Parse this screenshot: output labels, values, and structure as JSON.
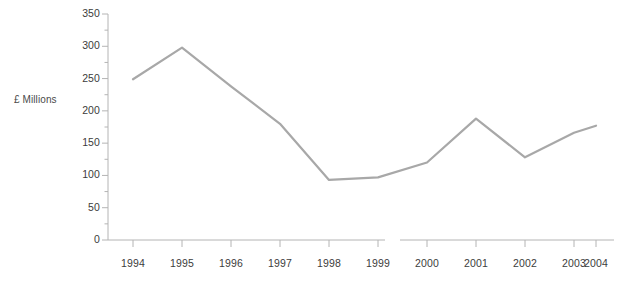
{
  "chart_data": {
    "type": "line",
    "title": "",
    "xlabel": "",
    "ylabel": "£ Millions",
    "categories": [
      "1994",
      "1995",
      "1996",
      "1997",
      "1998",
      "1999",
      "2000",
      "2001",
      "2002",
      "2003",
      "2004"
    ],
    "values": [
      249,
      298,
      238,
      180,
      93,
      97,
      120,
      188,
      128,
      166,
      177
    ],
    "series": [
      {
        "name": "£ Millions",
        "values": [
          249,
          298,
          238,
          180,
          93,
          97,
          120,
          188,
          128,
          166,
          177
        ]
      }
    ],
    "ylim": [
      0,
      350
    ],
    "ytick_labels": [
      "0",
      "50",
      "100",
      "150",
      "200",
      "250",
      "300",
      "350"
    ],
    "ytick_values": [
      0,
      50,
      100,
      150,
      200,
      250,
      300,
      350
    ],
    "minor_ticks": true,
    "minor_tick_interval": 25,
    "grid": false,
    "legend": "none",
    "axis_break": {
      "present": true,
      "between": [
        "1999",
        "2000"
      ]
    },
    "line_color": "#a8a8a8",
    "line_width": 2.2,
    "axis_color": "#b4b4b4",
    "text_color": "#3c3c3c",
    "background": "#ffffff"
  },
  "geometry": {
    "plot_left": 108,
    "plot_right": 614,
    "plot_top": 14,
    "plot_bottom": 240,
    "x_positions": [
      133,
      182,
      231,
      280,
      329,
      378,
      427,
      476,
      525,
      574,
      596
    ],
    "break_gap": [
      385,
      400
    ]
  }
}
